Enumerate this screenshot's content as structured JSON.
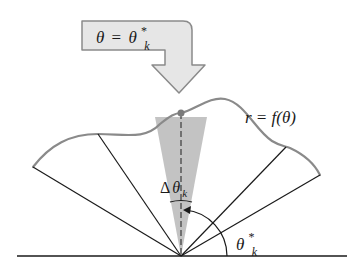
{
  "diagram": {
    "type": "polar-area-element",
    "arrow_label": {
      "lhs": "θ",
      "equals": "=",
      "rhs_base": "θ",
      "rhs_sup": "*",
      "rhs_sub": "k"
    },
    "curve_label": "r = f(θ)",
    "wedge_label": {
      "delta": "Δ",
      "base": "θ",
      "sub": "k"
    },
    "angle_label": {
      "base": "θ",
      "sup": "*",
      "sub": "k"
    },
    "colors": {
      "curve": "#8a8a8a",
      "wedge": "#bdbdbd",
      "arrow_fill": "#e6e6e6",
      "arrow_stroke": "#8a8a8a",
      "lines": "#1a1a1a",
      "point": "#7a7a7a"
    }
  }
}
